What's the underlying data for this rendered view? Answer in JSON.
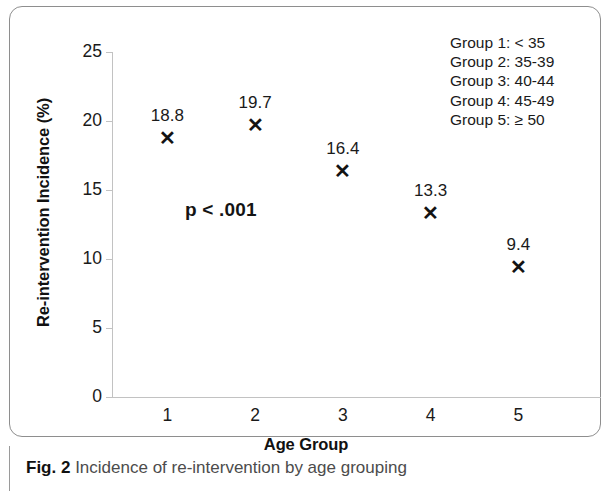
{
  "caption": {
    "label": "Fig. 2",
    "text": "Incidence of re-intervention by age grouping"
  },
  "chart_data": {
    "type": "scatter",
    "title": "",
    "xlabel": "Age Group",
    "ylabel": "Re-intervention Incidence (%)",
    "categories": [
      "1",
      "2",
      "3",
      "4",
      "5"
    ],
    "values": [
      18.8,
      19.7,
      16.4,
      13.3,
      9.4
    ],
    "point_labels": [
      "18.8",
      "19.7",
      "16.4",
      "13.3",
      "9.4"
    ],
    "marker": "x",
    "marker_color": "#131313",
    "ylim": [
      0,
      25
    ],
    "ytick_labels": [
      "25",
      "20",
      "15",
      "10",
      "5",
      "0"
    ],
    "ytick_values": [
      25,
      20,
      15,
      10,
      5,
      0
    ],
    "xtick_labels": [
      "1",
      "2",
      "3",
      "4",
      "5"
    ],
    "grid": false,
    "legend_position": "top-right",
    "axis_color": "#c2c2c2",
    "annotations": [
      {
        "name": "p-value",
        "text": "p < .001"
      }
    ],
    "legend": [
      "Group 1: < 35",
      "Group 2: 35-39",
      "Group 3: 40-44",
      "Group 4: 45-49",
      "Group 5: ≥ 50"
    ]
  }
}
